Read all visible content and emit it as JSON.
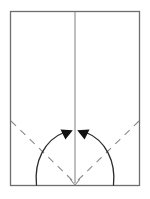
{
  "figure": {
    "width": 150,
    "height": 199,
    "background_color": "#ffffff"
  },
  "colors": {
    "outline": "#6e6e6e",
    "crease_solid": "#8a8a8a",
    "crease_dashed": "#8a8a8a",
    "arrow_stroke": "#2b2b2b",
    "arrow_head_fill": "#111111",
    "notch": "#8a8a8a",
    "paper_fill": "#ffffff"
  },
  "strokes": {
    "outline_width": 1.3,
    "crease_solid_width": 1.1,
    "crease_dashed_width": 1.1,
    "dash_pattern": "7 6",
    "arrow_width": 1.3,
    "notch_width": 1.1
  },
  "sheet": {
    "label": "paper-sheet",
    "x": 10.5,
    "y": 11.5,
    "width": 129,
    "height": 174
  },
  "center_crease": {
    "label": "vertical center crease",
    "x": 75,
    "y_start": 12,
    "y_end": 183,
    "style": "solid"
  },
  "fold_lines": [
    {
      "label": "left diagonal valley fold",
      "x1": 11,
      "y1": 121,
      "x2": 74,
      "y2": 182,
      "style": "dashed"
    },
    {
      "label": "right diagonal valley fold",
      "x1": 139,
      "y1": 121,
      "x2": 76,
      "y2": 182,
      "style": "dashed"
    }
  ],
  "arrows": [
    {
      "label": "left fold arrow",
      "path": "M 36.5 185 C 34 162 44 140 65 132",
      "head": {
        "tip_x": 72.5,
        "tip_y": 130.5,
        "points": "72.8,130.2 60.5,129.6 65.4,139.4",
        "direction": "up-right toward center"
      }
    },
    {
      "label": "right fold arrow",
      "path": "M 113.5 185 C 116 162 106 140 85 132",
      "head": {
        "tip_x": 77.5,
        "tip_y": 130.5,
        "points": "77.2,130.2 89.5,129.6 84.6,139.4",
        "direction": "up-left toward center"
      }
    }
  ],
  "notch": {
    "label": "bottom center v notch",
    "points": "70.5,179.5 75,185 79.5,179.5"
  }
}
